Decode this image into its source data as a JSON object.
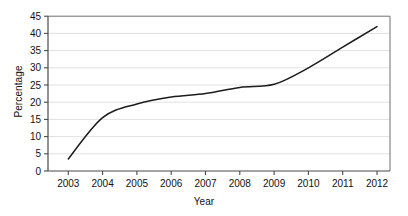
{
  "chart_data": {
    "type": "line",
    "title": "",
    "xlabel": "Year",
    "ylabel": "Percentage",
    "x": [
      2003,
      2004,
      2005,
      2006,
      2007,
      2008,
      2009,
      2010,
      2011,
      2012
    ],
    "categories": [
      "2003",
      "2004",
      "2005",
      "2006",
      "2007",
      "2008",
      "2009",
      "2010",
      "2011",
      "2012"
    ],
    "values": [
      3.5,
      15.5,
      19.5,
      21.5,
      22.5,
      24.3,
      25.2,
      30.0,
      36.0,
      42.0
    ],
    "series": [
      {
        "name": "Percentage",
        "values": [
          3.5,
          15.5,
          19.5,
          21.5,
          22.5,
          24.3,
          25.2,
          30.0,
          36.0,
          42.0
        ]
      }
    ],
    "xlim": [
      2002.6,
      2012.4
    ],
    "ylim": [
      0,
      45
    ],
    "ytick_labels": [
      "0",
      "5",
      "10",
      "15",
      "20",
      "25",
      "30",
      "35",
      "40",
      "45"
    ],
    "ytick_values": [
      0,
      5,
      10,
      15,
      20,
      25,
      30,
      35,
      40,
      45
    ],
    "xtick_labels": [
      "2003",
      "2004",
      "2005",
      "2006",
      "2007",
      "2008",
      "2009",
      "2010",
      "2011",
      "2012"
    ],
    "grid": "horizontal",
    "legend": "none",
    "line_color": "#1c1c1c",
    "grid_color": "#d9d9d9",
    "axis_color": "#4a4a4a",
    "annotations": []
  }
}
